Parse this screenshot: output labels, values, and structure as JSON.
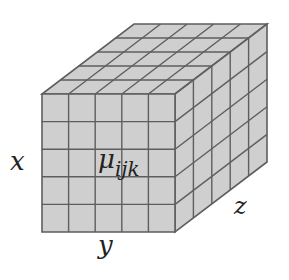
{
  "diagram": {
    "type": "3d-grid-cube",
    "grid": {
      "rows": 5,
      "cols": 5,
      "depth": 5
    },
    "colors": {
      "face": "#cfcfcf",
      "line": "#5e5e5e",
      "background": "#ffffff"
    },
    "labels": {
      "x": "x",
      "y": "y",
      "z": "z",
      "mu_symbol": "μ",
      "mu_subscript": "ijk"
    }
  }
}
